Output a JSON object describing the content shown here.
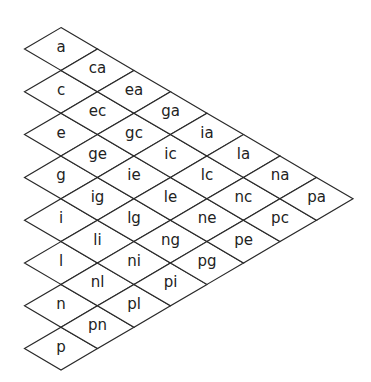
{
  "diagram": {
    "type": "triangular-diamond-grid",
    "letters": [
      "a",
      "c",
      "e",
      "g",
      "i",
      "l",
      "n",
      "p"
    ],
    "columns": [
      [
        "a",
        "c",
        "e",
        "g",
        "i",
        "l",
        "n",
        "p"
      ],
      [
        "ca",
        "ec",
        "ge",
        "ig",
        "li",
        "nl",
        "pn"
      ],
      [
        "ea",
        "gc",
        "ie",
        "lg",
        "ni",
        "pl"
      ],
      [
        "ga",
        "ic",
        "le",
        "ng",
        "pi"
      ],
      [
        "ia",
        "lc",
        "ne",
        "pg"
      ],
      [
        "la",
        "nc",
        "pe"
      ],
      [
        "na",
        "pc"
      ],
      [
        "pa"
      ]
    ],
    "geometry": {
      "origin_x": 61,
      "origin_y": 49,
      "half_width": 36.5,
      "half_height": 21.4,
      "row_step": 42.8
    },
    "colors": {
      "stroke": "#2a2a2a",
      "text": "#222222",
      "background": "#ffffff"
    }
  }
}
